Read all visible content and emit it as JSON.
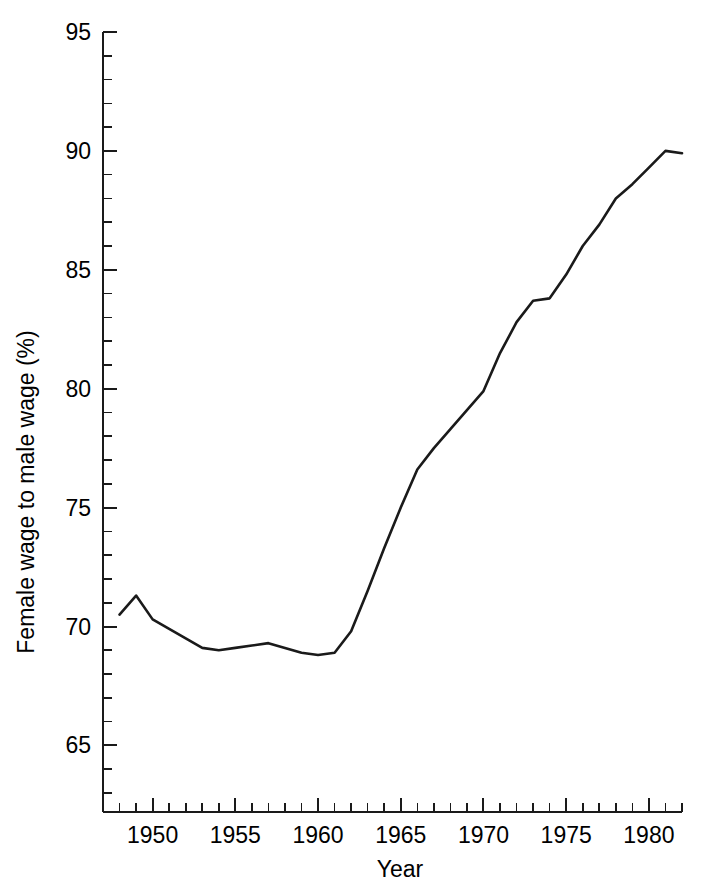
{
  "chart_data": {
    "type": "line",
    "title": "",
    "xlabel": "Year",
    "ylabel": "Female wage to male wage (%)",
    "xlim": [
      1947,
      1982
    ],
    "ylim": [
      62.2,
      95
    ],
    "grid": false,
    "legend": "none",
    "x_tick_labels": [
      "1950",
      "1955",
      "1960",
      "1965",
      "1970",
      "1975",
      "1980"
    ],
    "x_tick_values": [
      1950,
      1955,
      1960,
      1965,
      1970,
      1975,
      1980
    ],
    "x_minor_tick_interval": 1,
    "y_tick_labels": [
      "65",
      "70",
      "75",
      "80",
      "85",
      "90",
      "95"
    ],
    "y_tick_values": [
      65,
      70,
      75,
      80,
      85,
      90,
      95
    ],
    "y_minor_tick_interval": 1,
    "series": [
      {
        "name": "Female wage to male wage ratio",
        "color": "#1a1a1a",
        "x": [
          1948,
          1949,
          1950,
          1951,
          1952,
          1953,
          1954,
          1955,
          1956,
          1957,
          1958,
          1959,
          1960,
          1961,
          1962,
          1963,
          1964,
          1965,
          1966,
          1967,
          1968,
          1969,
          1970,
          1971,
          1972,
          1973,
          1974,
          1975,
          1976,
          1977,
          1978,
          1979,
          1980,
          1981,
          1982
        ],
        "values": [
          70.5,
          71.3,
          70.3,
          69.9,
          69.5,
          69.1,
          69.0,
          69.1,
          69.2,
          69.3,
          69.1,
          68.9,
          68.8,
          68.9,
          69.8,
          71.5,
          73.3,
          75.0,
          76.6,
          77.5,
          78.3,
          79.1,
          79.9,
          81.5,
          82.8,
          83.7,
          83.8,
          84.8,
          86.0,
          86.9,
          88.0,
          88.6,
          89.3,
          90.0,
          89.9
        ]
      }
    ]
  },
  "axes": {
    "y_axis_title": "Female wage to male wage (%)",
    "x_axis_title": "Year"
  }
}
